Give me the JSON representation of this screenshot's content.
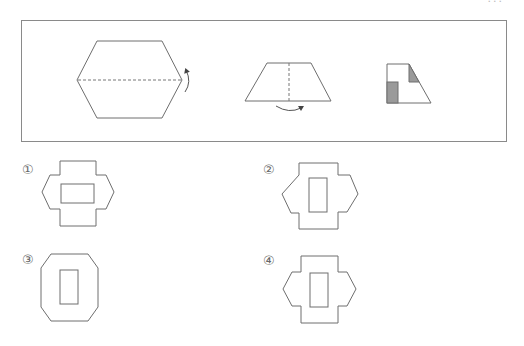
{
  "header": {
    "cut_off_text": "..."
  },
  "problem": {
    "frame_label": "paper-folding-and-cutting-problem",
    "steps": [
      {
        "name": "hexagon-paper",
        "fold": "fold along horizontal dashed line, bottom half up",
        "arrow": "curved-arrow-up"
      },
      {
        "name": "trapezoid-folded",
        "fold": "fold along vertical dashed line, left to right",
        "arrow": "curved-arrow-right"
      },
      {
        "name": "final-folded-shape",
        "cut": "shaded regions are cut out",
        "shaded_regions": 2
      }
    ],
    "colors": {
      "line": "#6e6e6e",
      "shade": "#9a9a9a"
    }
  },
  "choices": [
    {
      "label": "①",
      "shape": "hexagon-with-notches, horizontal rectangle hole"
    },
    {
      "label": "②",
      "shape": "asymmetric hexagon-with-notches, vertical rectangle hole"
    },
    {
      "label": "③",
      "shape": "octagon, vertical rectangle hole"
    },
    {
      "label": "④",
      "shape": "hexagon-with-notches, vertical rectangle hole"
    }
  ]
}
